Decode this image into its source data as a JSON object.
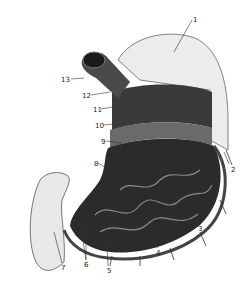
{
  "figure": {
    "labels": [
      {
        "id": "1",
        "text": "1",
        "x": 193,
        "y": 17
      },
      {
        "id": "2",
        "text": "2",
        "x": 231,
        "y": 167
      },
      {
        "id": "3",
        "text": "3",
        "x": 198,
        "y": 226
      },
      {
        "id": "4",
        "text": "4",
        "x": 156,
        "y": 250
      },
      {
        "id": "5",
        "text": "5",
        "x": 107,
        "y": 268
      },
      {
        "id": "6",
        "text": "6",
        "x": 84,
        "y": 262
      },
      {
        "id": "7",
        "text": "7",
        "x": 61,
        "y": 265
      },
      {
        "id": "8",
        "text": "8",
        "x": 94,
        "y": 161
      },
      {
        "id": "9",
        "text": "9",
        "x": 101,
        "y": 139
      },
      {
        "id": "10",
        "text": "10",
        "x": 95,
        "y": 123
      },
      {
        "id": "11",
        "text": "11",
        "x": 93,
        "y": 107
      },
      {
        "id": "12",
        "text": "12",
        "x": 82,
        "y": 93
      },
      {
        "id": "13",
        "text": "13",
        "x": 61,
        "y": 77
      }
    ]
  }
}
